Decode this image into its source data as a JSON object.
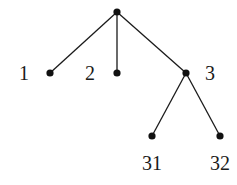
{
  "diagram": {
    "type": "tree",
    "root": "root",
    "nodes": [
      {
        "id": "root",
        "label": ""
      },
      {
        "id": "n1",
        "label": "1"
      },
      {
        "id": "n2",
        "label": "2"
      },
      {
        "id": "n3",
        "label": "3"
      },
      {
        "id": "n31",
        "label": "31"
      },
      {
        "id": "n32",
        "label": "32"
      }
    ],
    "edges": [
      {
        "from": "root",
        "to": "n1"
      },
      {
        "from": "root",
        "to": "n2"
      },
      {
        "from": "root",
        "to": "n3"
      },
      {
        "from": "n3",
        "to": "n31"
      },
      {
        "from": "n3",
        "to": "n32"
      }
    ]
  }
}
